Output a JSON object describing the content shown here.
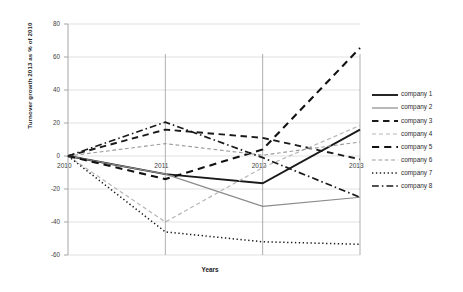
{
  "chart_data": {
    "type": "line",
    "title": "",
    "xlabel": "Years",
    "ylabel": "Turnover growth 2013 as % of 2010",
    "categories": [
      "2010",
      "2011",
      "2012",
      "2013"
    ],
    "x": [
      2010,
      2011,
      2012,
      2013
    ],
    "ylim": [
      -60,
      80
    ],
    "yticks": [
      -60,
      -40,
      -20,
      0,
      20,
      40,
      60,
      80
    ],
    "ytick_labels": [
      "-60",
      "-40",
      "-20",
      "0",
      "20",
      "40",
      "60",
      "80"
    ],
    "grid": "horizontal",
    "legend_position": "right",
    "series": [
      {
        "name": "company 1",
        "values": [
          0,
          -11,
          -16.5,
          16
        ],
        "style": "solid",
        "color": "#1a1a1a",
        "width": 1.9
      },
      {
        "name": "company 2",
        "values": [
          0,
          -11,
          -30.5,
          -25
        ],
        "style": "solid",
        "color": "#8a8a8a",
        "width": 1.2
      },
      {
        "name": "company 3",
        "values": [
          0,
          16,
          11,
          -2
        ],
        "style": "dashed",
        "color": "#1a1a1a",
        "width": 1.9
      },
      {
        "name": "company 4",
        "values": [
          0,
          -40,
          -7,
          18.5
        ],
        "style": "dashed",
        "color": "#b5b5b5",
        "width": 1.2
      },
      {
        "name": "company 5",
        "values": [
          0,
          -14,
          4,
          65.5
        ],
        "style": "dashed",
        "color": "#111111",
        "width": 2.1
      },
      {
        "name": "company 6",
        "values": [
          0,
          7.5,
          0.5,
          8.5
        ],
        "style": "dashed",
        "color": "#9a9a9a",
        "width": 1.1
      },
      {
        "name": "company 7",
        "values": [
          0,
          -46,
          -52,
          -53.5
        ],
        "style": "dotted",
        "color": "#1a1a1a",
        "width": 1.5
      },
      {
        "name": "company 8",
        "values": [
          0,
          20.5,
          -1,
          -25
        ],
        "style": "dashdot",
        "color": "#1a1a1a",
        "width": 1.7
      }
    ],
    "xaxis_label_positions": [
      "2010",
      "2011",
      "2012",
      "2013"
    ],
    "plot_border_color": "#a6a6a6",
    "gridline_color": "#d9d9d9",
    "background_color": "#ffffff"
  }
}
